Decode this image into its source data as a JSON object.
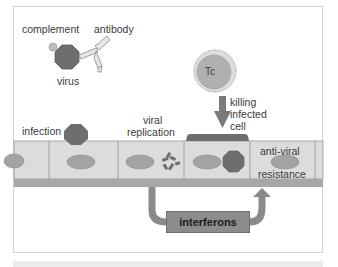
{
  "diagram": {
    "labels": {
      "complement": "complement",
      "antibody": "antibody",
      "virus": "virus",
      "tc": "Tc",
      "killing": [
        "killing",
        "infected",
        "cell"
      ],
      "infection": "infection",
      "viral_replication": [
        "viral",
        "replication"
      ],
      "anti_viral": "anti-viral",
      "resistance": "resistance",
      "interferons": "interferons"
    },
    "colors": {
      "virus": "#6e6e6e",
      "cell_fill": "#dcdcdc",
      "nucleus": "#a3a3a3",
      "membrane": "#a8a8a8",
      "arrow": "#8a8a8a",
      "tc_cell": "#b4b4b4"
    }
  }
}
